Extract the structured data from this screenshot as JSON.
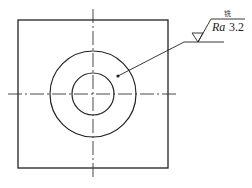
{
  "drawing": {
    "type": "engineering-drawing",
    "part": "square plate with circular hole",
    "line_color": "#222222",
    "centerline_color": "#333333",
    "square": {
      "x": 18,
      "y": 20,
      "size": 150
    },
    "center": {
      "x": 93,
      "y": 94
    },
    "outer_circle_radius": 43,
    "inner_circle_radius": 21
  },
  "annotation": {
    "process": "铣",
    "parameter": "Ra",
    "value": "3.2",
    "symbol": "surface-roughness-machined"
  }
}
